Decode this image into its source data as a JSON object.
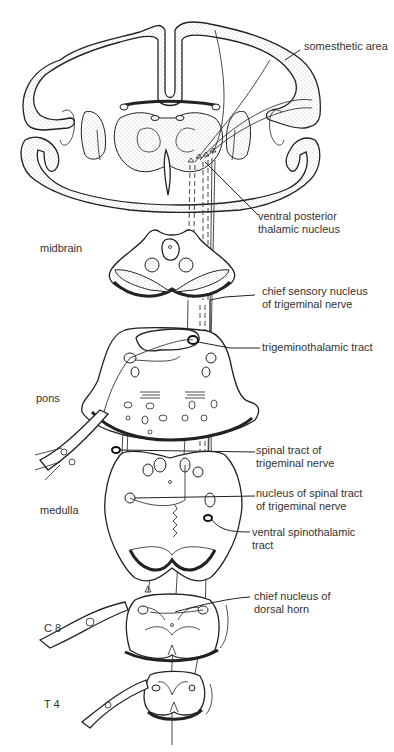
{
  "diagram": {
    "regions": [
      {
        "id": "midbrain",
        "label": "midbrain"
      },
      {
        "id": "pons",
        "label": "pons"
      },
      {
        "id": "medulla",
        "label": "medulla"
      },
      {
        "id": "c8",
        "label": "C 8"
      },
      {
        "id": "t4",
        "label": "T 4"
      }
    ],
    "labels": {
      "somesthetic_area": "somesthetic area",
      "ventral_posterior": "ventral posterior\nthalamic nucleus",
      "chief_sensory": "chief sensory nucleus\nof trigeminal nerve",
      "trigeminothalamic": "trigeminothalamic tract",
      "spinal_tract": "spinal tract of\ntrigeminal nerve",
      "nucleus_spinal_tract": "nucleus of spinal tract\nof trigeminal nerve",
      "ventral_spinothalamic": "ventral spinothalamic\ntract",
      "chief_dorsal_horn": "chief nucleus of\ndorsal horn"
    },
    "colors": {
      "line": "#222222",
      "text": "#333333",
      "background": "#ffffff"
    }
  }
}
